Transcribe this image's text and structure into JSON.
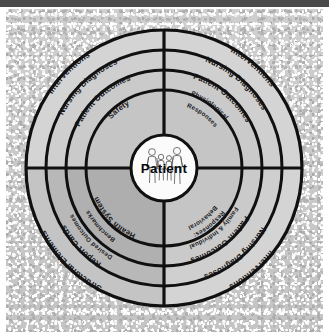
{
  "figure": {
    "type": "concentric-ring-diagram",
    "center_label": "Patient",
    "center_icon": "family-figures-icon",
    "background": "#c6c6c6",
    "ink_color": "#111111",
    "top_bar_color": "#4a4a4a"
  },
  "center": {
    "label": "Patient",
    "icon_name": "family-figures-icon"
  },
  "rings": [
    {
      "index": 1,
      "name": "inner-ring",
      "fill": "#c3c3c3",
      "labels": {
        "upper_left": "Safety",
        "upper_right": "Physiological Responses",
        "lower_left": "Health System",
        "lower_right": "Behavioral Responses: Family & Individual"
      }
    },
    {
      "index": 2,
      "name": "second-ring",
      "fill": "#c8c8c8",
      "labels": {
        "upper_left": "Patient Outcomes",
        "upper_right": "Patient Outcomes",
        "lower_left": "Benchmarks Desired Outcomes",
        "lower_right": "Patient Outcomes"
      }
    },
    {
      "index": 3,
      "name": "third-ring",
      "fill": "#cdcdcd",
      "labels": {
        "upper_left": "Nursing Diagnoses",
        "upper_right": "Nursing Diagnoses",
        "lower_left": "Report Cards",
        "lower_right": "Nursing Diagnoses"
      }
    },
    {
      "index": 4,
      "name": "outer-ring",
      "fill": "#d2d2d2",
      "labels": {
        "upper_left": "Interventions",
        "upper_right": "Interventions",
        "lower_left": "Structural Elements",
        "lower_right": "Interventions"
      }
    }
  ],
  "quadrants": [
    {
      "name": "upper-left",
      "shaded": false
    },
    {
      "name": "upper-right",
      "shaded": false
    },
    {
      "name": "lower-left",
      "shaded": true
    },
    {
      "name": "lower-right",
      "shaded": false
    }
  ],
  "labels": {
    "inner_ul": "Safety",
    "inner_ur_line1": "Physiological",
    "inner_ur_line2": "Responses",
    "inner_ll": "Health System",
    "inner_lr_line1": "Behavioral",
    "inner_lr_line2": "Responses:",
    "inner_lr_line3": "Family & Individual",
    "r2_ul": "Patient Outcomes",
    "r2_ur": "Patient Outcomes",
    "r2_ll_line1": "Benchmarks",
    "r2_ll_line2": "Desired Outcomes",
    "r2_lr": "Patient Outcomes",
    "r3_ul": "Nursing Diagnoses",
    "r3_ur": "Nursing Diagnoses",
    "r3_ll": "Report Cards",
    "r3_lr": "Nursing Diagnoses",
    "r4_ul": "Interventions",
    "r4_ur": "Interventions",
    "r4_ll": "Structural Elements",
    "r4_lr": "Interventions",
    "center": "Patient"
  }
}
